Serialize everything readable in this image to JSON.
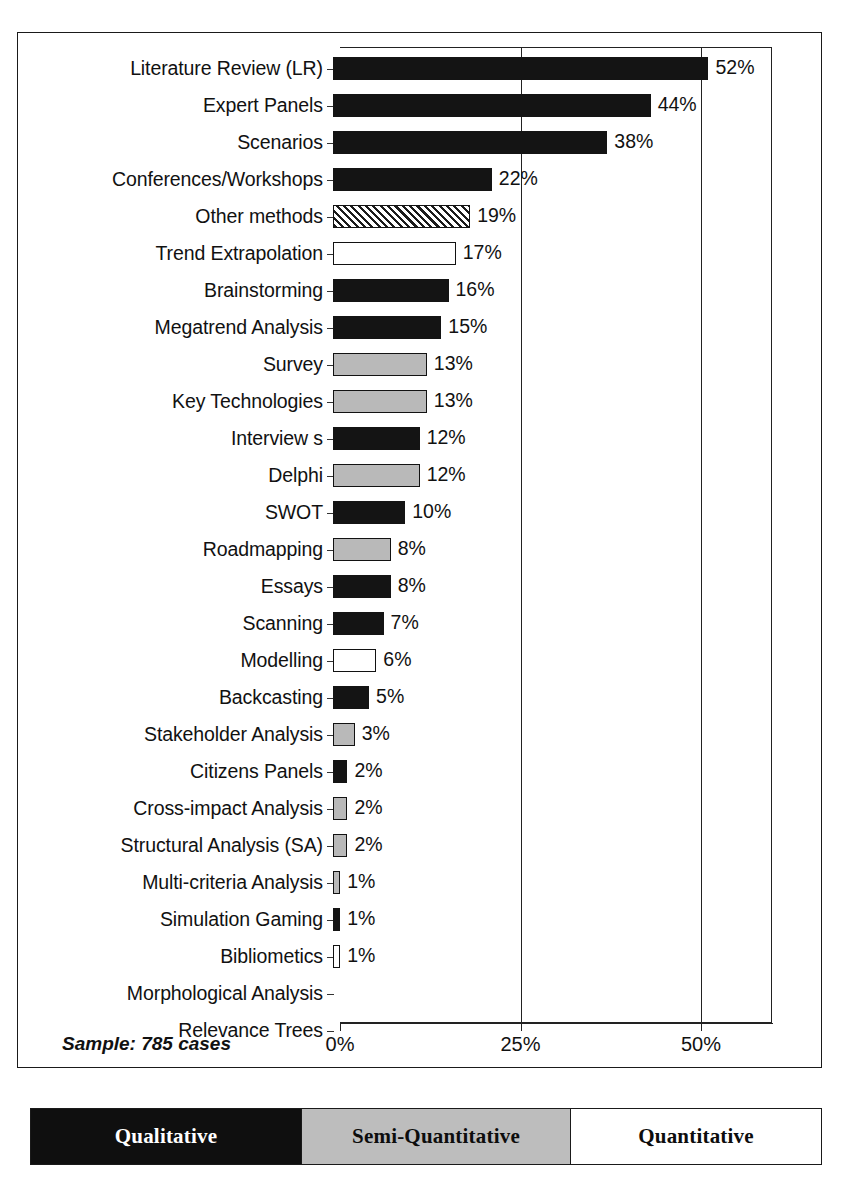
{
  "scan_artifact_text": "",
  "chart_data": {
    "type": "bar",
    "orientation": "horizontal",
    "title": "",
    "xlabel": "",
    "ylabel": "",
    "xlim": [
      0,
      60
    ],
    "xticks": [
      "0%",
      "25%",
      "50%"
    ],
    "xtick_values": [
      0,
      25,
      50
    ],
    "grid": true,
    "sample_note": "Sample: 785 cases",
    "categories": [
      "Literature Review  (LR)",
      "Expert Panels",
      "Scenarios",
      "Conferences/Workshops",
      "Other methods",
      "Trend Extrapolation",
      "Brainstorming",
      "Megatrend Analysis",
      "Survey",
      "Key Technologies",
      "Interview s",
      "Delphi",
      "SWOT",
      "Roadmapping",
      "Essays",
      "Scanning",
      "Modelling",
      "Backcasting",
      "Stakeholder Analysis",
      "Citizens Panels",
      "Cross-impact Analysis",
      "Structural Analysis (SA)",
      "Multi-criteria Analysis",
      "Simulation Gaming",
      "Bibliometics",
      "Morphological Analysis",
      "Relevance Trees"
    ],
    "values": [
      52,
      44,
      38,
      22,
      19,
      17,
      16,
      15,
      13,
      13,
      12,
      12,
      10,
      8,
      8,
      7,
      6,
      5,
      3,
      2,
      2,
      2,
      1,
      1,
      1,
      0,
      0
    ],
    "value_labels": [
      "52%",
      "44%",
      "38%",
      "22%",
      "19%",
      "17%",
      "16%",
      "15%",
      "13%",
      "13%",
      "12%",
      "12%",
      "10%",
      "8%",
      "8%",
      "7%",
      "6%",
      "5%",
      "3%",
      "2%",
      "2%",
      "2%",
      "1%",
      "1%",
      "1%",
      "",
      ""
    ],
    "bar_types": [
      "qualitative",
      "qualitative",
      "qualitative",
      "qualitative",
      "other",
      "quantitative",
      "qualitative",
      "qualitative",
      "semi-quantitative",
      "semi-quantitative",
      "qualitative",
      "semi-quantitative",
      "qualitative",
      "semi-quantitative",
      "qualitative",
      "qualitative",
      "quantitative",
      "qualitative",
      "semi-quantitative",
      "qualitative",
      "semi-quantitative",
      "semi-quantitative",
      "semi-quantitative",
      "qualitative",
      "quantitative",
      "none",
      "none"
    ]
  },
  "legend": {
    "segments": [
      {
        "label": "Qualitative",
        "color": "#0f0f0f"
      },
      {
        "label": "Semi-Quantitative",
        "color": "#bdbdbd"
      },
      {
        "label": "Quantitative",
        "color": "#ffffff"
      }
    ]
  },
  "colors": {
    "qualitative": "#141414",
    "semi_quantitative": "#b9b9b9",
    "quantitative": "#ffffff",
    "other_hatch": "#1b1b1b",
    "frame": "#1a1a1a"
  }
}
